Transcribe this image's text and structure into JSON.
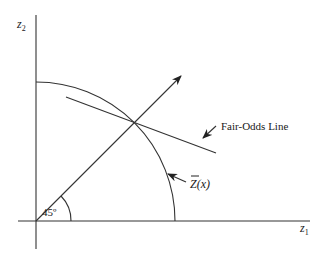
{
  "diagram": {
    "axes": {
      "y_label": "z",
      "y_sub": "2",
      "x_label": "z",
      "x_sub": "1"
    },
    "angle_label": "45º",
    "curve_label_main": "Z",
    "curve_label_arg": "(x)",
    "fair_odds_label": "Fair-Odds Line",
    "colors": {
      "stroke": "#333333",
      "background": "#ffffff"
    }
  }
}
